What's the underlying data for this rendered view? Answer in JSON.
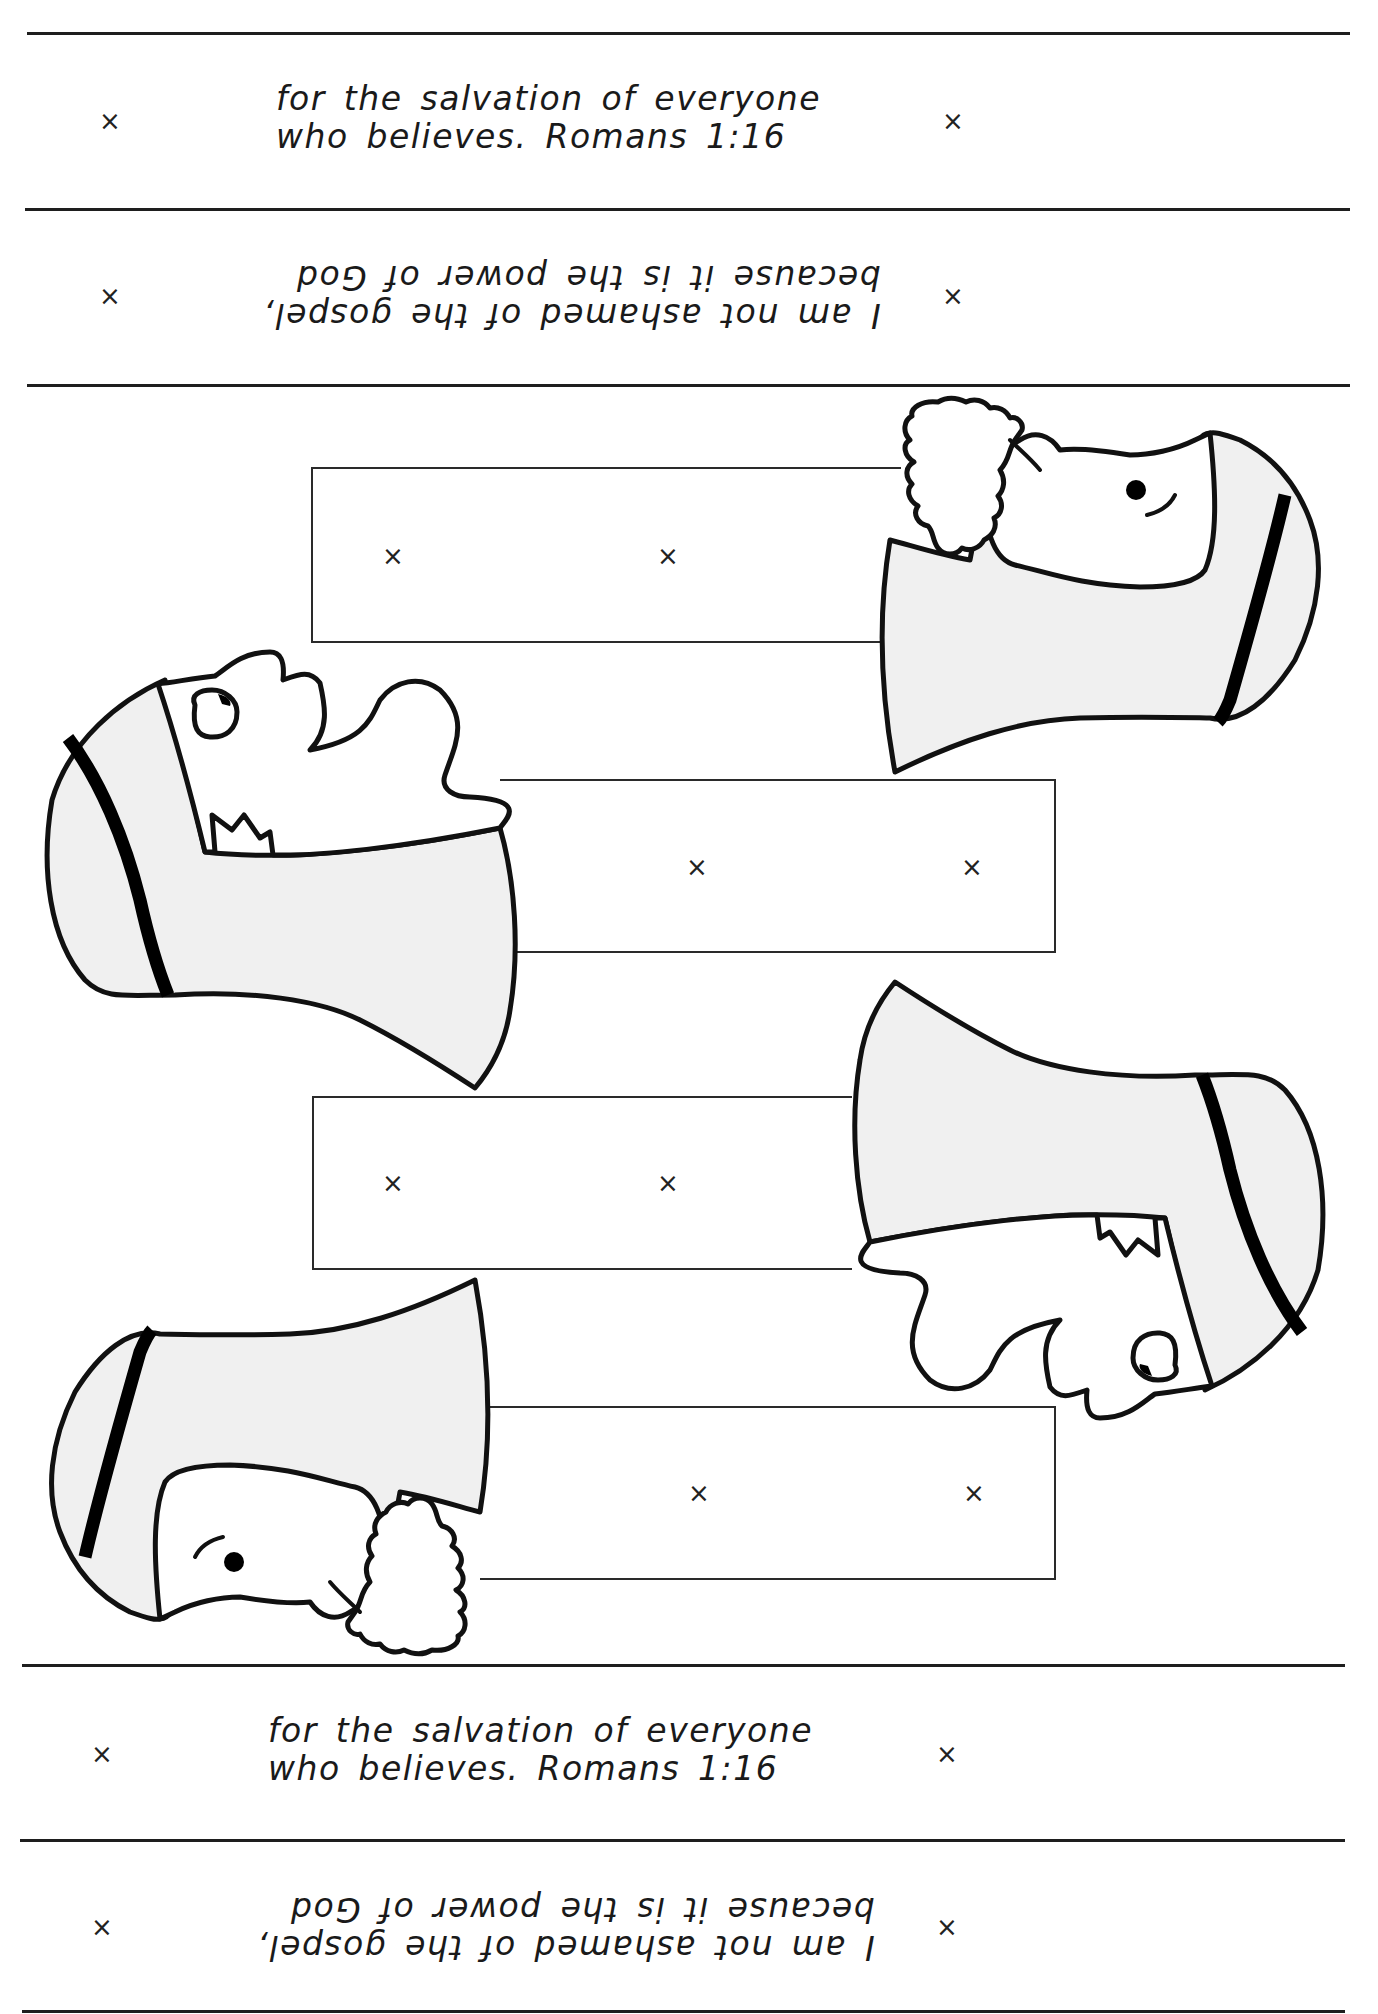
{
  "document": {
    "title": "Memory verse puppet cut-out sheet",
    "mark_glyph": "×",
    "top_strips": [
      {
        "lines": [
          "for the salvation of everyone",
          "who believes. Romans 1:16"
        ],
        "orientation": "upright"
      },
      {
        "lines": [
          "I am not ashamed of the gospel,",
          "because it is the power of God"
        ],
        "orientation": "upside-down"
      }
    ],
    "bottom_strips": [
      {
        "lines": [
          "for the salvation of everyone",
          "who believes. Romans 1:16"
        ],
        "orientation": "upright"
      },
      {
        "lines": [
          "I am not ashamed of the gospel,",
          "because it is the power of God"
        ],
        "orientation": "upside-down"
      }
    ],
    "puppets": [
      {
        "name": "puppet-1",
        "figure": "bearded man with headscarf",
        "position": "top-right"
      },
      {
        "name": "puppet-2",
        "figure": "man with headscarf, hand raised",
        "position": "middle-left"
      },
      {
        "name": "puppet-3",
        "figure": "man with headscarf, hand raised (rotated)",
        "position": "middle-right"
      },
      {
        "name": "puppet-4",
        "figure": "bearded man with headscarf (rotated)",
        "position": "bottom-left"
      }
    ],
    "colors": {
      "ink": "#111111",
      "robe_fill": "#f0f0f0",
      "paper": "#ffffff"
    }
  }
}
